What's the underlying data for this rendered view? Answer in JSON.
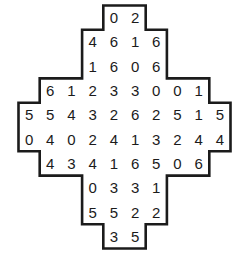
{
  "puzzle": {
    "name": "domino-number-grid",
    "shape": "stepped-cross",
    "outline_color": "#1b1b1b",
    "background_color": "#ffffff",
    "digit_color": "#1b1b1b",
    "columns": 10,
    "rows": 10,
    "rows_data": [
      {
        "row_index": 0,
        "start_col": 4,
        "values": [
          0,
          2
        ]
      },
      {
        "row_index": 1,
        "start_col": 3,
        "values": [
          4,
          6,
          1,
          6
        ]
      },
      {
        "row_index": 2,
        "start_col": 3,
        "values": [
          1,
          6,
          0,
          6
        ]
      },
      {
        "row_index": 3,
        "start_col": 1,
        "values": [
          6,
          1,
          2,
          3,
          3,
          0,
          0,
          1
        ]
      },
      {
        "row_index": 4,
        "start_col": 0,
        "values": [
          5,
          5,
          4,
          3,
          2,
          6,
          2,
          5,
          1,
          5
        ]
      },
      {
        "row_index": 5,
        "start_col": 0,
        "values": [
          0,
          4,
          0,
          2,
          4,
          1,
          3,
          2,
          4,
          4
        ]
      },
      {
        "row_index": 6,
        "start_col": 1,
        "values": [
          4,
          3,
          4,
          1,
          6,
          5,
          0,
          6
        ]
      },
      {
        "row_index": 7,
        "start_col": 3,
        "values": [
          0,
          3,
          3,
          1
        ]
      },
      {
        "row_index": 8,
        "start_col": 3,
        "values": [
          5,
          5,
          2,
          2
        ]
      },
      {
        "row_index": 9,
        "start_col": 4,
        "values": [
          3,
          5
        ]
      }
    ]
  }
}
